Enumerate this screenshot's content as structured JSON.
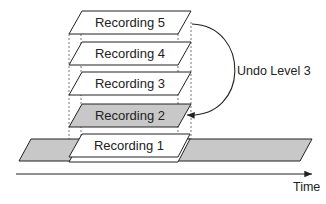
{
  "diagram": {
    "layers": [
      {
        "label": "Recording 5",
        "fill": "#ffffff"
      },
      {
        "label": "Recording 4",
        "fill": "#ffffff"
      },
      {
        "label": "Recording 3",
        "fill": "#ffffff"
      },
      {
        "label": "Recording 2",
        "fill": "#c8c8c8"
      },
      {
        "label": "Recording 1",
        "fill": "#ffffff"
      }
    ],
    "track_fill": "#c8c8c8",
    "undo_label": "Undo Level 3",
    "axis_label": "Time"
  }
}
